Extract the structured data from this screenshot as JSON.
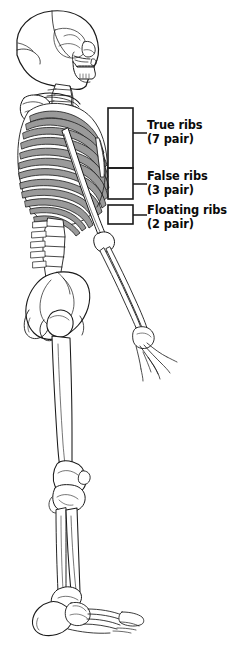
{
  "figure": {
    "view": "left lateral",
    "background_color": "#ffffff",
    "line_color": "#1a1a1a",
    "bone_fill": "#ffffff",
    "shade_fill": "#9a9a9a"
  },
  "annotations": {
    "bracket_color": "#1a1a1a",
    "items": [
      {
        "id": "true-ribs",
        "line1": "True ribs",
        "line2": "(7 pair)",
        "count": 7,
        "unit": "pair",
        "bracket": {
          "x": 108,
          "y": 108,
          "width": 25,
          "height": 60
        },
        "leader": {
          "x1": 133,
          "y1": 133,
          "x2": 147,
          "y2": 133
        }
      },
      {
        "id": "false-ribs",
        "line1": "False ribs",
        "line2": "(3 pair)",
        "count": 3,
        "unit": "pair",
        "bracket": {
          "x": 108,
          "y": 168,
          "width": 25,
          "height": 31
        },
        "leader": {
          "x1": 133,
          "y1": 184,
          "x2": 147,
          "y2": 184
        }
      },
      {
        "id": "floating-ribs",
        "line1": "Floating ribs",
        "line2": "(2 pair)",
        "count": 2,
        "unit": "pair",
        "bracket": {
          "x": 108,
          "y": 205,
          "width": 25,
          "height": 19
        },
        "leader": {
          "x1": 133,
          "y1": 215,
          "x2": 147,
          "y2": 215
        }
      }
    ]
  },
  "skeleton_regions": [
    {
      "name": "skull",
      "label": "cranium and mandible, lateral"
    },
    {
      "name": "cervical-spine",
      "label": "cervical vertebrae"
    },
    {
      "name": "clavicle",
      "label": "clavicle"
    },
    {
      "name": "scapula",
      "label": "scapula"
    },
    {
      "name": "rib-cage",
      "label": "thoracic cage"
    },
    {
      "name": "sternum",
      "label": "sternum"
    },
    {
      "name": "humerus",
      "label": "humerus"
    },
    {
      "name": "radius-ulna",
      "label": "radius and ulna"
    },
    {
      "name": "hand",
      "label": "carpals, metacarpals, phalanges"
    },
    {
      "name": "lumbar-spine",
      "label": "lumbar vertebrae"
    },
    {
      "name": "pelvis",
      "label": "os coxae / ilium"
    },
    {
      "name": "femur",
      "label": "femur"
    },
    {
      "name": "patella",
      "label": "patella"
    },
    {
      "name": "tibia-fibula",
      "label": "tibia and fibula"
    },
    {
      "name": "foot",
      "label": "tarsals, metatarsals, phalanges"
    }
  ]
}
